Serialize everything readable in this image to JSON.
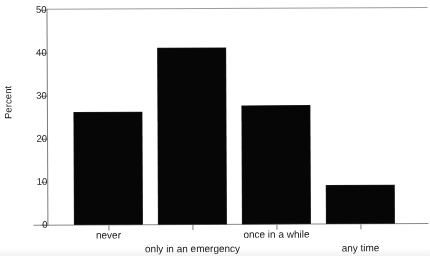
{
  "chart_data": {
    "type": "bar",
    "title": "",
    "subtitle": "",
    "xlabel": "",
    "ylabel": "Percent",
    "categories": [
      "never",
      "only in an emergency",
      "once in a while",
      "any time"
    ],
    "values": [
      26,
      41,
      27.5,
      8.8
    ],
    "ylim": [
      0,
      50
    ],
    "yticks": [
      0,
      10,
      20,
      30,
      40,
      50
    ],
    "ytick_labels": [
      "0",
      "10",
      "20",
      "30",
      "40",
      "50"
    ],
    "grid": false,
    "legend": null,
    "bar_color": "#0a0a0a",
    "axis_color": "#7c7c7c",
    "background": "#ffffff"
  }
}
